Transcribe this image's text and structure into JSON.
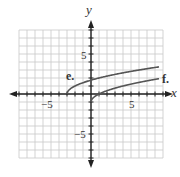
{
  "chart_data": {
    "type": "line",
    "title": "",
    "xlabel": "x",
    "ylabel": "y",
    "xlim": [
      -9,
      9
    ],
    "ylim": [
      -8,
      8
    ],
    "grid": true,
    "tick_labels": {
      "x": [
        {
          "value": -5,
          "label": "−5"
        },
        {
          "value": 5,
          "label": "5"
        }
      ],
      "y": [
        {
          "value": 5,
          "label": "5"
        },
        {
          "value": -5,
          "label": "−5"
        }
      ]
    },
    "series": [
      {
        "name": "e.",
        "equation": "y = sqrt(x + 3)",
        "x_start": -3,
        "x_end": 8.5,
        "points": [
          [
            -3,
            0
          ],
          [
            -2,
            1
          ],
          [
            1,
            2
          ],
          [
            6,
            3
          ],
          [
            8,
            3.32
          ]
        ]
      },
      {
        "name": "f.",
        "equation": "y = sqrt(x) - 1",
        "x_start": 0,
        "x_end": 8.5,
        "points": [
          [
            0,
            -1
          ],
          [
            1,
            0
          ],
          [
            4,
            1
          ],
          [
            8,
            1.83
          ]
        ]
      }
    ],
    "colors": {
      "grid": "#c8c8c8",
      "axis": "#222222",
      "curve": "#555555"
    }
  },
  "labels": {
    "x_axis": "x",
    "y_axis": "y",
    "x_neg5": "−5",
    "x_pos5": "5",
    "y_pos5": "5",
    "y_neg5": "−5",
    "curve_e": "e.",
    "curve_f": "f."
  }
}
